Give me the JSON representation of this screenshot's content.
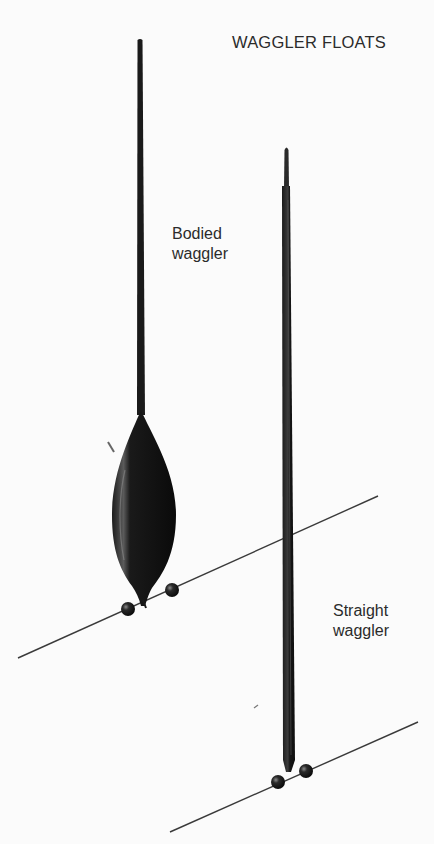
{
  "title": "WAGGLER FLOATS",
  "labels": {
    "bodied": {
      "line1": "Bodied",
      "line2": "waggler"
    },
    "straight": {
      "line1": "Straight",
      "line2": "waggler"
    }
  },
  "figures": [
    {
      "name": "bodied-waggler-float",
      "shape": "long thin stem with elongated dark oval body",
      "locking_shots": 2
    },
    {
      "name": "straight-waggler-float",
      "shape": "long straight cane with tapered tip",
      "locking_shots": 2
    }
  ],
  "colors": {
    "background": "#fbfbfb",
    "float": "#151515",
    "line": "#3a3a3a",
    "text": "#2b2b2b"
  }
}
